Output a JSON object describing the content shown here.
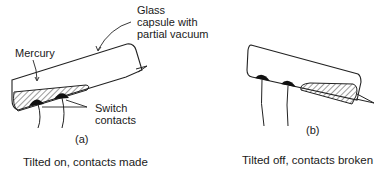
{
  "diagram": {
    "panel_a": {
      "labels": {
        "glass_line1": "Glass",
        "glass_line2": "capsule with",
        "glass_line3": "partial vacuum",
        "mercury": "Mercury",
        "switch_line1": "Switch",
        "switch_line2": "contacts",
        "panel_id": "(a)"
      },
      "caption": "Tilted on, contacts made"
    },
    "panel_b": {
      "labels": {
        "panel_id": "(b)"
      },
      "caption": "Tilted off, contacts broken"
    }
  }
}
